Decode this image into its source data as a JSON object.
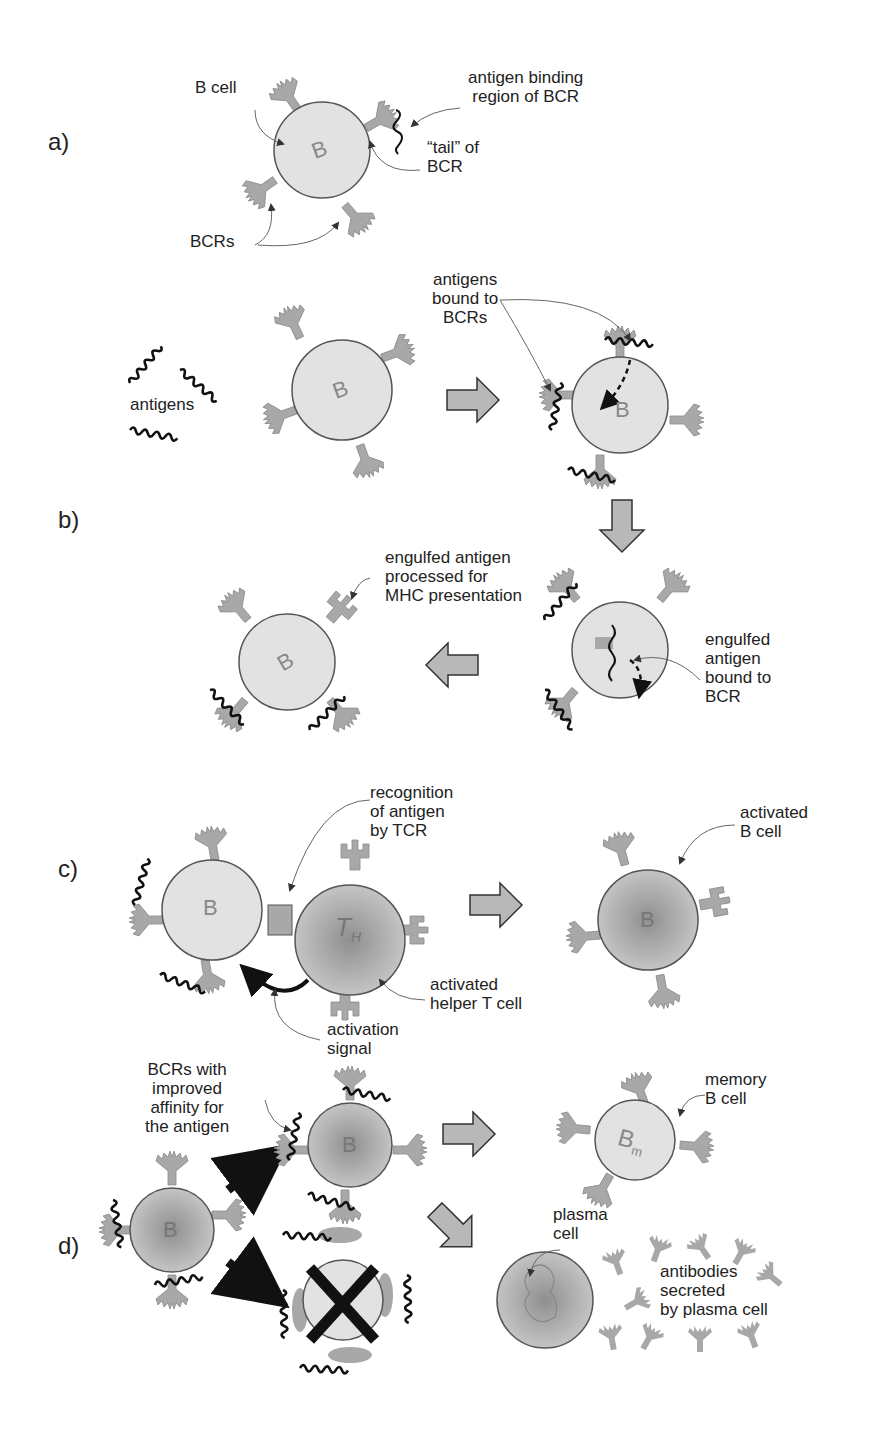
{
  "sections": {
    "a": "a)",
    "b": "b)",
    "c": "c)",
    "d": "d)"
  },
  "cell_letters": {
    "b_cell": "B",
    "helper_t": "T",
    "helper_t_sub": "H",
    "memory": "B",
    "memory_sub": "m"
  },
  "labels": {
    "a_b_cell": "B cell",
    "a_antigen_binding_region": "antigen binding\nregion of BCR",
    "a_tail": "“tail” of\nBCR",
    "a_bcrs": "BCRs",
    "b_antigens": "antigens",
    "b_antigens_bound": "antigens\nbound to\nBCRs",
    "b_engulfed_processed": "engulfed antigen\nprocessed for\nMHC presentation",
    "b_engulfed_bound": "engulfed\nantigen\nbound to\nBCR",
    "c_recognition": "recognition\nof antigen\nby TCR",
    "c_activated_b": "activated\nB cell",
    "c_activated_helper": "activated\nhelper T cell",
    "c_activation_signal": "activation\nsignal",
    "d_bcrs_improved": "BCRs with\nimproved\naffinity for\nthe antigen",
    "d_memory": "memory\nB cell",
    "d_plasma": "plasma\ncell",
    "d_antibodies": "antibodies\nsecreted\nby plasma cell"
  },
  "colors": {
    "cell_light": "#e2e2e2",
    "cell_dark": "#b4b4b4",
    "receptor": "#a8a8a8",
    "arrow_fill": "#b8b8b8",
    "outline": "#555555",
    "antigen": "#111111"
  }
}
